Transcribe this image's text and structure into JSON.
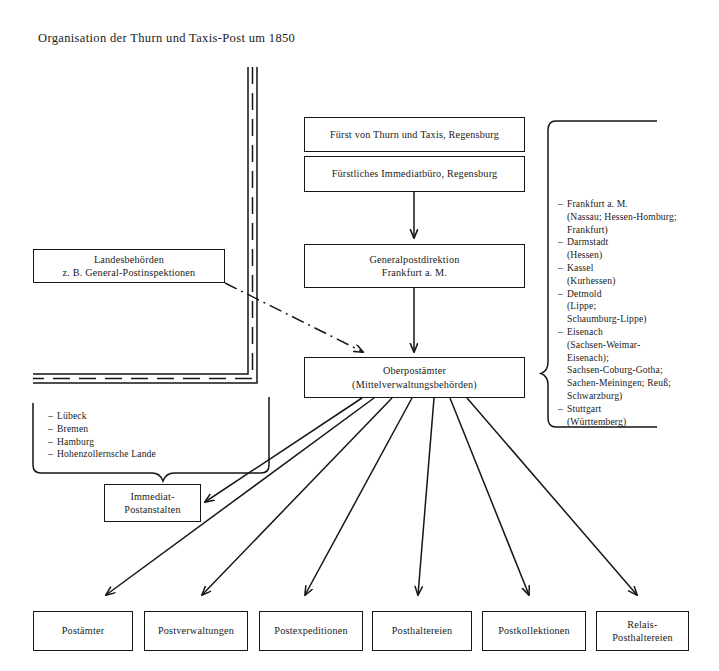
{
  "title": "Organisation der Thurn und Taxis-Post um 1850",
  "nodes": {
    "fuerst": "Fürst von Thurn und Taxis, Regensburg",
    "immediatbuero": "Fürstliches Immediatbüro, Regensburg",
    "generalpostdirektion": "Generalpostdirektion\nFrankfurt a. M.",
    "landesbehoerden": "Landesbehörden\nz. B. General-Postinspektionen",
    "oberpostaemter": "Oberpostämter\n(Mittelverwaltungsbehörden)",
    "immediat_postanstalten": "Immediat-\nPostanstalten"
  },
  "oberpostaemter_regions": [
    {
      "name": "Frankfurt a. M.",
      "detail": "(Nassau; Hessen-Homburg;\nFrankfurt)"
    },
    {
      "name": "Darmstadt",
      "detail": "(Hessen)"
    },
    {
      "name": "Kassel",
      "detail": "(Kurhessen)"
    },
    {
      "name": "Detmold",
      "detail": "(Lippe;\nSchaumburg-Lippe)"
    },
    {
      "name": "Eisenach",
      "detail": "(Sachsen-Weimar-\nEisenach);\nSachsen-Coburg-Gotha;\nSachen-Meiningen; Reuß;\nSchwarzburg)"
    },
    {
      "name": "Stuttgart",
      "detail": "(Württemberg)"
    }
  ],
  "immediat_regions": [
    {
      "name": "Lübeck"
    },
    {
      "name": "Bremen"
    },
    {
      "name": "Hamburg"
    },
    {
      "name": "Hohenzollernsche Lande"
    }
  ],
  "bottom_offices": [
    "Postämter",
    "Postverwaltungen",
    "Postexpeditionen",
    "Posthaltereien",
    "Postkollektionen",
    "Relais-\nPosthaltereien"
  ],
  "colors": {
    "ink": "#15151a",
    "text": "#1a1a1a",
    "paper": "#ffffff"
  }
}
